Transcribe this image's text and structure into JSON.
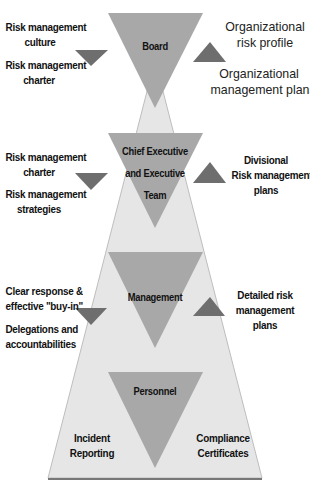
{
  "diagram": {
    "colors": {
      "background": "#ffffff",
      "pyramid_fill": "#e6e6e6",
      "pyramid_edge": "#9a9a9a",
      "level_triangle_fill": "#a8a8a8",
      "arrow_fill": "#6e6e6e",
      "base_line": "#777777"
    },
    "levels": [
      {
        "name": "Board",
        "inputs": [
          "Risk management culture",
          "Risk management charter"
        ],
        "outputs": [
          "Organizational risk profile",
          "Organizational management plans"
        ]
      },
      {
        "name": "Chief Executive and Executive Team",
        "inputs": [
          "Risk management charter",
          "Risk management strategies"
        ],
        "outputs": [
          "Divisional Risk management plans"
        ]
      },
      {
        "name": "Management",
        "inputs": [
          "Clear response & effective \"buy-in\"",
          "Delegations and accountabilities"
        ],
        "outputs": [
          "Detailed risk management plans"
        ]
      },
      {
        "name": "Personnel",
        "inputs": [
          "Incident Reporting"
        ],
        "outputs": [
          "Compliance Certificates"
        ]
      }
    ]
  },
  "labels": {
    "board": "Board",
    "ceo_line1": "Chief Executive",
    "ceo_line2": "and Executive",
    "ceo_line3": "Team",
    "management": "Management",
    "personnel": "Personnel",
    "board_in_1a": "Risk  management",
    "board_in_1b": "culture",
    "board_in_2a": "Risk management",
    "board_in_2b": "charter",
    "board_out_1a": "Organizational",
    "board_out_1b": "risk profile",
    "board_out_2a": "Organizational",
    "board_out_2b": "management plans",
    "ceo_in_1a": "Risk management",
    "ceo_in_1b": "charter",
    "ceo_in_2a": "Risk management",
    "ceo_in_2b": "strategies",
    "ceo_out_a": "Divisional",
    "ceo_out_b": "Risk management",
    "ceo_out_c": "plans",
    "mgmt_in_1a": "Clear response &",
    "mgmt_in_1b": "effective \"buy-in\"",
    "mgmt_in_2a": "Delegations and",
    "mgmt_in_2b": "accountabilities",
    "mgmt_out_a": "Detailed risk",
    "mgmt_out_b": "management",
    "mgmt_out_c": "plans",
    "pers_in_a": "Incident",
    "pers_in_b": "Reporting",
    "pers_out_a": "Compliance",
    "pers_out_b": "Certificates"
  }
}
